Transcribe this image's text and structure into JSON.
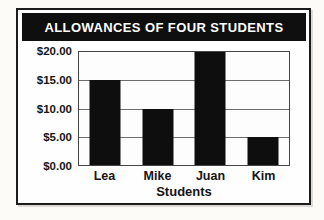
{
  "title_banner": {
    "label": "ALLOWANCES OF FOUR STUDENTS"
  },
  "chart_data": {
    "type": "bar",
    "title": "ALLOWANCES OF FOUR STUDENTS",
    "categories": [
      "Lea",
      "Mike",
      "Juan",
      "Kim"
    ],
    "values": [
      15,
      10,
      20,
      5
    ],
    "xlabel": "Students",
    "ylabel": "",
    "ylim": [
      0,
      20
    ],
    "ytick_step": 5,
    "ytick_labels_top_to_bottom": [
      "$20.00",
      "$15.00",
      "$10.00",
      "$5.00",
      "$0.00"
    ],
    "grid": true,
    "legend": false
  },
  "colors": {
    "banner_bg": "#0f0f0f",
    "banner_text": "#ffffff",
    "bar": "#0e0e0e",
    "gridline": "#6e6e6e",
    "plot_border": "#454545",
    "card_border": "#1c1c1c",
    "card_bg": "#fefefe",
    "page_bg": "#fcfbf8"
  }
}
